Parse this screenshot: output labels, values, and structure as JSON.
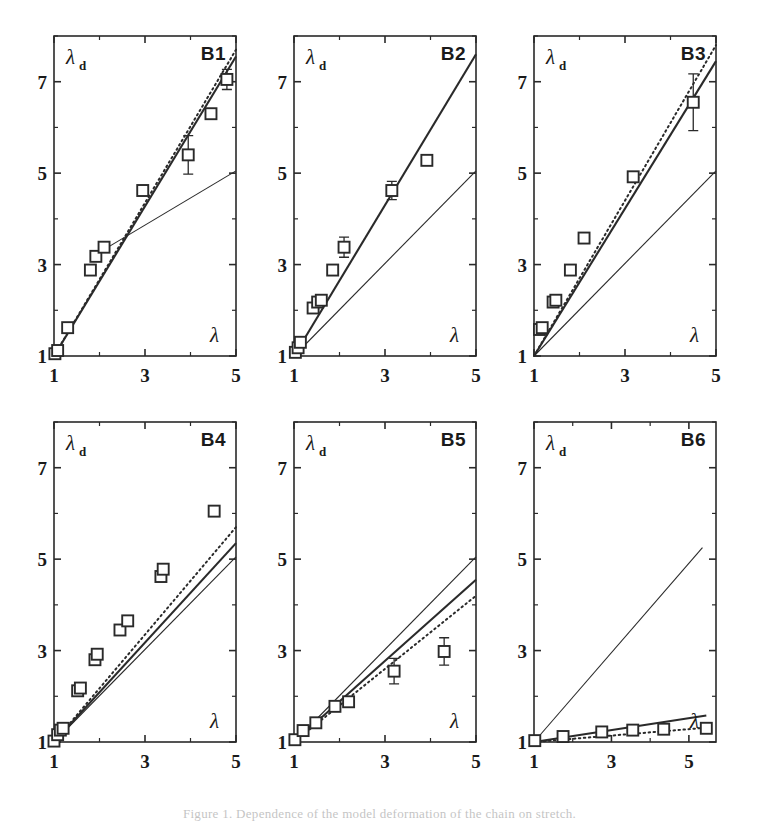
{
  "figure": {
    "caption": "Figure 1.  Dependence of the model deformation of the chain on stretch.",
    "panel_count": 6,
    "grid": {
      "rows": 2,
      "cols": 3
    }
  },
  "axes_common": {
    "xlabel": "λ",
    "ylabel": "λ",
    "ylabel_subscript": "d",
    "xticks": [
      1,
      3,
      5
    ],
    "yticks": [
      1,
      3,
      5,
      7
    ],
    "xlim": [
      1,
      5
    ],
    "ylim": [
      1,
      8
    ],
    "grid": false,
    "minor_ticks": true
  },
  "legend_series": [
    {
      "name": "data",
      "style": "open-square",
      "label": "experiment"
    },
    {
      "name": "reference",
      "style": "thin-solid",
      "label": "affine"
    },
    {
      "name": "model-solid",
      "style": "thick-solid",
      "label": "model"
    },
    {
      "name": "model-dotted",
      "style": "dotted",
      "label": "model-alt"
    }
  ],
  "chart_data": [
    {
      "type": "scatter",
      "id": "B1",
      "title": "B1",
      "xlabel": "λ",
      "ylabel": "λ_d",
      "xlim": [
        1,
        5
      ],
      "ylim": [
        1,
        8
      ],
      "xticks": [
        1,
        3,
        5
      ],
      "yticks": [
        1,
        3,
        5,
        7
      ],
      "grid": false,
      "points": [
        {
          "x": 1.02,
          "y": 1.05,
          "err": 0.0
        },
        {
          "x": 1.08,
          "y": 1.12,
          "err": 0.0
        },
        {
          "x": 1.3,
          "y": 1.62,
          "err": 0.0
        },
        {
          "x": 1.8,
          "y": 2.88,
          "err": 0.0
        },
        {
          "x": 1.92,
          "y": 3.18,
          "err": 0.0
        },
        {
          "x": 2.1,
          "y": 3.38,
          "err": 0.0
        },
        {
          "x": 2.95,
          "y": 4.62,
          "err": 0.0
        },
        {
          "x": 3.95,
          "y": 5.4,
          "err": 0.42
        },
        {
          "x": 4.45,
          "y": 6.3,
          "err": 0.0
        },
        {
          "x": 4.8,
          "y": 7.05,
          "err": 0.22
        }
      ],
      "reference_line": {
        "from": [
          2.05,
          3.3
        ],
        "to": [
          5.0,
          5.05
        ]
      },
      "model_solid": {
        "from": [
          1.0,
          1.0
        ],
        "to": [
          5.0,
          7.55
        ]
      },
      "model_dotted": {
        "from": [
          1.0,
          1.0
        ],
        "to": [
          5.0,
          7.7
        ]
      }
    },
    {
      "type": "scatter",
      "id": "B2",
      "title": "B2",
      "xlabel": "λ",
      "ylabel": "λ_d",
      "xlim": [
        1,
        5
      ],
      "ylim": [
        1,
        8
      ],
      "xticks": [
        1,
        3,
        5
      ],
      "yticks": [
        1,
        3,
        5,
        7
      ],
      "grid": false,
      "points": [
        {
          "x": 1.03,
          "y": 1.08,
          "err": 0.0
        },
        {
          "x": 1.09,
          "y": 1.18,
          "err": 0.0
        },
        {
          "x": 1.14,
          "y": 1.3,
          "err": 0.0
        },
        {
          "x": 1.42,
          "y": 2.05,
          "err": 0.0
        },
        {
          "x": 1.52,
          "y": 2.18,
          "err": 0.0
        },
        {
          "x": 1.6,
          "y": 2.22,
          "err": 0.0
        },
        {
          "x": 1.85,
          "y": 2.88,
          "err": 0.0
        },
        {
          "x": 2.1,
          "y": 3.38,
          "err": 0.22
        },
        {
          "x": 3.15,
          "y": 4.62,
          "err": 0.2
        },
        {
          "x": 3.92,
          "y": 5.28,
          "err": 0.0
        }
      ],
      "reference_line": {
        "from": [
          1.0,
          1.0
        ],
        "to": [
          5.0,
          5.05
        ]
      },
      "model_solid": {
        "from": [
          1.0,
          1.0
        ],
        "to": [
          5.0,
          7.6
        ]
      },
      "model_dotted": null
    },
    {
      "type": "scatter",
      "id": "B3",
      "title": "B3",
      "xlabel": "λ",
      "ylabel": "λ_d",
      "xlim": [
        1,
        5
      ],
      "ylim": [
        1,
        8
      ],
      "xticks": [
        1,
        3,
        5
      ],
      "yticks": [
        1,
        3,
        5,
        7
      ],
      "grid": false,
      "points": [
        {
          "x": 1.12,
          "y": 1.58,
          "err": 0.0
        },
        {
          "x": 1.18,
          "y": 1.62,
          "err": 0.0
        },
        {
          "x": 1.42,
          "y": 2.18,
          "err": 0.0
        },
        {
          "x": 1.48,
          "y": 2.22,
          "err": 0.0
        },
        {
          "x": 1.8,
          "y": 2.88,
          "err": 0.0
        },
        {
          "x": 2.1,
          "y": 3.58,
          "err": 0.0
        },
        {
          "x": 3.18,
          "y": 4.92,
          "err": 0.0
        },
        {
          "x": 4.5,
          "y": 6.55,
          "err": 0.62
        }
      ],
      "reference_line": {
        "from": [
          1.0,
          1.0
        ],
        "to": [
          5.0,
          5.05
        ]
      },
      "model_solid": {
        "from": [
          1.0,
          1.0
        ],
        "to": [
          5.0,
          7.45
        ]
      },
      "model_dotted": {
        "from": [
          1.0,
          1.0
        ],
        "to": [
          5.0,
          7.8
        ]
      }
    },
    {
      "type": "scatter",
      "id": "B4",
      "title": "B4",
      "xlabel": "λ",
      "ylabel": "λ_d",
      "xlim": [
        1,
        5
      ],
      "ylim": [
        1,
        8
      ],
      "xticks": [
        1,
        3,
        5
      ],
      "yticks": [
        1,
        3,
        5,
        7
      ],
      "grid": false,
      "points": [
        {
          "x": 1.0,
          "y": 1.02,
          "err": 0.0
        },
        {
          "x": 1.08,
          "y": 1.16,
          "err": 0.0
        },
        {
          "x": 1.14,
          "y": 1.26,
          "err": 0.0
        },
        {
          "x": 1.2,
          "y": 1.3,
          "err": 0.0
        },
        {
          "x": 1.52,
          "y": 2.12,
          "err": 0.0
        },
        {
          "x": 1.58,
          "y": 2.18,
          "err": 0.0
        },
        {
          "x": 1.9,
          "y": 2.8,
          "err": 0.0
        },
        {
          "x": 1.95,
          "y": 2.92,
          "err": 0.0
        },
        {
          "x": 2.45,
          "y": 3.45,
          "err": 0.0
        },
        {
          "x": 2.62,
          "y": 3.65,
          "err": 0.0
        },
        {
          "x": 3.35,
          "y": 4.62,
          "err": 0.0
        },
        {
          "x": 3.4,
          "y": 4.78,
          "err": 0.0
        },
        {
          "x": 4.52,
          "y": 6.05,
          "err": 0.0
        }
      ],
      "reference_line": {
        "from": [
          1.0,
          1.0
        ],
        "to": [
          5.0,
          5.05
        ]
      },
      "model_solid": {
        "from": [
          1.0,
          1.0
        ],
        "to": [
          5.0,
          5.35
        ]
      },
      "model_dotted": {
        "from": [
          1.0,
          1.0
        ],
        "to": [
          5.0,
          5.7
        ]
      }
    },
    {
      "type": "scatter",
      "id": "B5",
      "title": "B5",
      "xlabel": "λ",
      "ylabel": "λ_d",
      "xlim": [
        1,
        5
      ],
      "ylim": [
        1,
        8
      ],
      "xticks": [
        1,
        3,
        5
      ],
      "yticks": [
        1,
        3,
        5,
        7
      ],
      "grid": false,
      "points": [
        {
          "x": 1.02,
          "y": 1.05,
          "err": 0.0
        },
        {
          "x": 1.2,
          "y": 1.25,
          "err": 0.0
        },
        {
          "x": 1.48,
          "y": 1.42,
          "err": 0.0
        },
        {
          "x": 1.9,
          "y": 1.78,
          "err": 0.0
        },
        {
          "x": 2.2,
          "y": 1.88,
          "err": 0.0
        },
        {
          "x": 3.2,
          "y": 2.55,
          "err": 0.28
        },
        {
          "x": 4.3,
          "y": 2.98,
          "err": 0.3
        }
      ],
      "reference_line": {
        "from": [
          1.0,
          1.0
        ],
        "to": [
          5.0,
          5.05
        ]
      },
      "model_solid": {
        "from": [
          1.0,
          1.0
        ],
        "to": [
          5.0,
          4.55
        ]
      },
      "model_dotted": {
        "from": [
          1.0,
          1.0
        ],
        "to": [
          5.0,
          4.2
        ]
      }
    },
    {
      "type": "scatter",
      "id": "B6",
      "title": "B6",
      "xlabel": "λ",
      "ylabel": "λ_d",
      "xlim": [
        1,
        5.7
      ],
      "ylim": [
        1,
        8
      ],
      "xticks": [
        1,
        3,
        5
      ],
      "yticks": [
        1,
        3,
        5,
        7
      ],
      "grid": false,
      "points": [
        {
          "x": 1.02,
          "y": 1.03,
          "err": 0.0
        },
        {
          "x": 1.75,
          "y": 1.12,
          "err": 0.0
        },
        {
          "x": 2.75,
          "y": 1.22,
          "err": 0.0
        },
        {
          "x": 3.55,
          "y": 1.26,
          "err": 0.0
        },
        {
          "x": 4.35,
          "y": 1.28,
          "err": 0.0
        },
        {
          "x": 5.45,
          "y": 1.3,
          "err": 0.0
        }
      ],
      "reference_line": {
        "from": [
          1.0,
          1.0
        ],
        "to": [
          5.35,
          5.25
        ]
      },
      "model_solid": {
        "from": [
          1.0,
          1.0
        ],
        "to": [
          5.45,
          1.58
        ]
      },
      "model_dotted": {
        "from": [
          1.0,
          1.0
        ],
        "to": [
          5.55,
          1.32
        ]
      }
    }
  ]
}
